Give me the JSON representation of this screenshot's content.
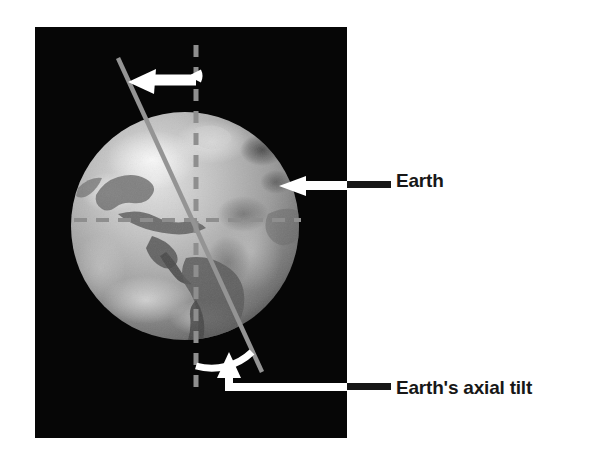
{
  "figure": {
    "background_color": "#ffffff",
    "panel": {
      "name": "earth-photo-panel",
      "background_color": "#060606",
      "x": 35,
      "y": 27,
      "width": 312,
      "height": 411
    },
    "globe": {
      "name": "earth-globe",
      "center_x": 185,
      "center_y": 226,
      "radius": 114,
      "surface_description": "grayscale satellite view of Earth showing the Americas and Atlantic Ocean",
      "base_color": "#9a9a9a",
      "highlight_color": "#d4d4d4",
      "shadow_color": "#4e4e4e"
    },
    "vertical_reference_line": {
      "name": "orbital-plane-normal-dashed-line",
      "color": "#8c8c8c",
      "style": "dashed",
      "x": 196,
      "y_top": 45,
      "y_bottom": 392
    },
    "horizontal_reference_line": {
      "name": "orbital-plane-dashed-line",
      "color": "#8c8c8c",
      "style": "dashed",
      "y": 220,
      "x_left": 74,
      "x_right": 300
    },
    "tilt_axis_line": {
      "name": "earth-rotation-axis-line",
      "color": "#8f8f8f",
      "x1": 118,
      "y1": 58,
      "x2": 262,
      "y2": 372,
      "tilt_degrees": 23.5
    },
    "rotation_arrow": {
      "name": "earth-rotation-direction-arrow",
      "color": "#ffffff",
      "direction": "left"
    },
    "tilt_arc": {
      "name": "axial-tilt-angle-arc",
      "color": "#ffffff"
    }
  },
  "callouts": [
    {
      "name": "callout-earth",
      "label": "Earth",
      "leader_color": "#171717",
      "arrow_color": "#ffffff",
      "arrow_direction": "left",
      "label_x": 396,
      "label_y": 170
    },
    {
      "name": "callout-earths-axial-tilt",
      "label": "Earth's axial tilt",
      "leader_color": "#171717",
      "arrow_color": "#ffffff",
      "arrow_direction": "up-left",
      "label_x": 396,
      "label_y": 377
    }
  ],
  "colors": {
    "page_background": "#ffffff",
    "panel_background": "#060606",
    "text": "#171717",
    "annotation_white": "#ffffff",
    "reference_gray": "#8c8c8c"
  }
}
